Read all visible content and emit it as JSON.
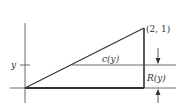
{
  "diagram": {
    "labels": {
      "vertex": "(2, 1)",
      "y_axis_tick": "y",
      "chord": "c(y)",
      "radius": "R(y)"
    },
    "colors": {
      "stroke": "#333333",
      "background": "#ffffff"
    }
  }
}
